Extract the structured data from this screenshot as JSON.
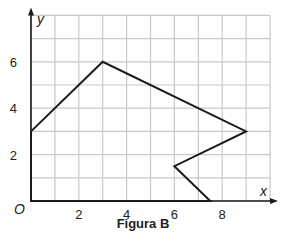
{
  "chart_data": {
    "type": "line",
    "title": "Figura B",
    "xlabel": "x",
    "ylabel": "y",
    "origin_label": "O",
    "xlim": [
      0,
      10
    ],
    "ylim": [
      0,
      8
    ],
    "grid": true,
    "grid_step": 1,
    "x_ticks": [
      2,
      4,
      6,
      8
    ],
    "y_ticks": [
      2,
      4,
      6
    ],
    "series": [
      {
        "name": "Figura B polygon",
        "closed": true,
        "points": [
          [
            0,
            3
          ],
          [
            3,
            6
          ],
          [
            9,
            3
          ],
          [
            6,
            1.5
          ],
          [
            7.5,
            0
          ],
          [
            0,
            0
          ]
        ]
      }
    ]
  },
  "caption": "Figura B",
  "colors": {
    "grid": "#c8c8c8",
    "line": "#1a1a1a",
    "axis": "#1a1a1a"
  }
}
